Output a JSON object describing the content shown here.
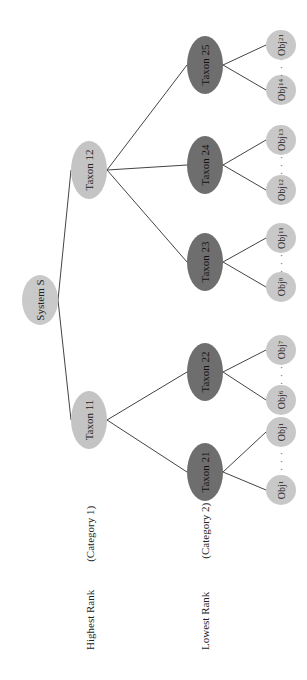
{
  "diagram": {
    "orientation": "rotated-90-ccw",
    "root": {
      "label": "System S"
    },
    "level1": [
      {
        "label": "Taxon 11"
      },
      {
        "label": "Taxon 12"
      }
    ],
    "level2": [
      {
        "label": "Taxon 21",
        "parent": "Taxon 11"
      },
      {
        "label": "Taxon 22",
        "parent": "Taxon 11"
      },
      {
        "label": "Taxon 23",
        "parent": "Taxon 12"
      },
      {
        "label": "Taxon 24",
        "parent": "Taxon 12"
      },
      {
        "label": "Taxon 25",
        "parent": "Taxon 12"
      }
    ],
    "leaves": [
      {
        "base": "Obj",
        "sub": "1",
        "parent": "Taxon 21"
      },
      {
        "base": "Obj",
        "sub": "1",
        "parent": "Taxon 21"
      },
      {
        "base": "Obj",
        "sub": "6",
        "parent": "Taxon 22"
      },
      {
        "base": "Obj",
        "sub": "7",
        "parent": "Taxon 22"
      },
      {
        "base": "Obj",
        "sub": "8",
        "parent": "Taxon 23"
      },
      {
        "base": "Obj",
        "sub": "11",
        "parent": "Taxon 23"
      },
      {
        "base": "Obj",
        "sub": "12",
        "parent": "Taxon 24"
      },
      {
        "base": "Obj",
        "sub": "13",
        "parent": "Taxon 24"
      },
      {
        "base": "Obj",
        "sub": "14",
        "parent": "Taxon 25"
      },
      {
        "base": "Obj",
        "sub": "21",
        "parent": "Taxon 25"
      }
    ],
    "ellipsis": "· · ·",
    "rank_labels": [
      {
        "rank": "Highest Rank",
        "category": "(Category 1)"
      },
      {
        "rank": "Lowest Rank",
        "category": "(Category 2)"
      }
    ],
    "colors": {
      "root_fill": "#c9c9c9",
      "level1_fill": "#c4c4c4",
      "level2_fill": "#6e6e6e",
      "leaf_fill": "#c8c8c8",
      "edge": "#444444"
    }
  }
}
